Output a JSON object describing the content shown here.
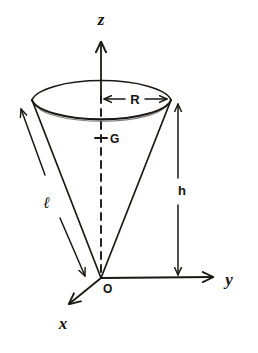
{
  "figure": {
    "background_color": "#ffffff",
    "ink_color": "#1a1715"
  },
  "axes": {
    "z": {
      "label": "z",
      "x": 101,
      "y": 20,
      "tip_x": 101,
      "tip_y": 40,
      "base_x": 101,
      "base_y": 98
    },
    "y": {
      "label": "y",
      "x": 229,
      "y": 282,
      "tip_x": 216,
      "tip_y": 277,
      "base_x": 101,
      "base_y": 278
    },
    "x": {
      "label": "x",
      "x": 63,
      "y": 327,
      "tip_x": 66,
      "tip_y": 303,
      "base_x": 101,
      "base_y": 278
    }
  },
  "points": {
    "origin": {
      "label": "O",
      "x": 103,
      "y": 292,
      "cx": 101,
      "cy": 278
    },
    "centroid": {
      "label": "G",
      "x": 110,
      "y": 143,
      "cx": 101,
      "cy": 138
    }
  },
  "dimensions": {
    "radius": {
      "label": "R",
      "x": 134,
      "y": 104,
      "line_y": 99,
      "from_x": 102,
      "to_x": 168
    },
    "height": {
      "label": "h",
      "x": 182,
      "y": 193,
      "line_x": 178,
      "from_y": 102,
      "to_y": 276
    },
    "slant": {
      "label": "ℓ",
      "x": 47,
      "y": 207
    }
  },
  "cone": {
    "apex": {
      "x": 101,
      "y": 278
    },
    "rim_center": {
      "x": 101,
      "y": 98
    },
    "rim_rx": 70,
    "rim_ry": 22,
    "left_rim": {
      "x": 32,
      "y": 100
    },
    "right_rim": {
      "x": 171,
      "y": 100
    }
  }
}
